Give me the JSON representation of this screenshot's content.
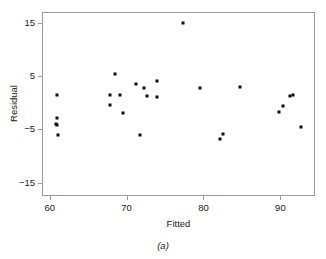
{
  "chart_data": {
    "type": "scatter",
    "title": "",
    "xlabel": "Fitted",
    "ylabel": "Residual",
    "caption": "(a)",
    "xlim": [
      59.0,
      94.5
    ],
    "ylim": [
      -17.5,
      17.0
    ],
    "xticks": [
      60,
      70,
      80,
      90
    ],
    "yticks": [
      15,
      5,
      -5,
      -15
    ],
    "xtick_labels": [
      "60",
      "70",
      "80",
      "90"
    ],
    "ytick_labels": [
      "15",
      "5",
      "−5",
      "−15"
    ],
    "grid": false,
    "legend": null,
    "marker": "square",
    "marker_color": "#0d0d0d",
    "frame_color": "#9a9a9a",
    "points": [
      {
        "x": 60.9,
        "y": 1.4
      },
      {
        "x": 60.9,
        "y": -2.8
      },
      {
        "x": 60.8,
        "y": -4.0
      },
      {
        "x": 60.9,
        "y": -4.2
      },
      {
        "x": 61.1,
        "y": -6.0
      },
      {
        "x": 68.5,
        "y": 5.4
      },
      {
        "x": 67.8,
        "y": 1.4
      },
      {
        "x": 69.2,
        "y": 1.4
      },
      {
        "x": 67.8,
        "y": -0.4
      },
      {
        "x": 69.5,
        "y": -2.0
      },
      {
        "x": 71.2,
        "y": 3.5
      },
      {
        "x": 72.3,
        "y": 2.7
      },
      {
        "x": 72.7,
        "y": 1.3
      },
      {
        "x": 74.0,
        "y": 4.1
      },
      {
        "x": 74.0,
        "y": 1.1
      },
      {
        "x": 71.8,
        "y": -6.0
      },
      {
        "x": 77.4,
        "y": 14.9
      },
      {
        "x": 79.5,
        "y": 2.7
      },
      {
        "x": 84.8,
        "y": 2.9
      },
      {
        "x": 82.2,
        "y": -6.8
      },
      {
        "x": 82.6,
        "y": -5.8
      },
      {
        "x": 91.2,
        "y": 1.3
      },
      {
        "x": 91.7,
        "y": 1.5
      },
      {
        "x": 90.4,
        "y": -0.6
      },
      {
        "x": 89.8,
        "y": -1.7
      },
      {
        "x": 92.7,
        "y": -4.6
      }
    ]
  },
  "figure": {
    "background": "#ffffff"
  }
}
